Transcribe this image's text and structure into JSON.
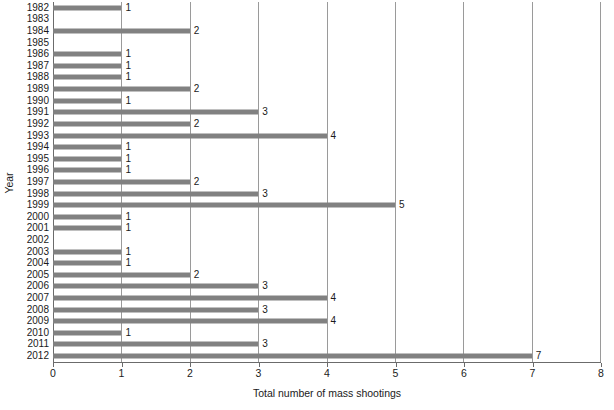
{
  "chart_data": {
    "type": "bar",
    "orientation": "horizontal",
    "title": "",
    "xlabel": "Total number of mass shootings",
    "ylabel": "Year",
    "categories": [
      "1982",
      "1983",
      "1984",
      "1985",
      "1986",
      "1987",
      "1988",
      "1989",
      "1990",
      "1991",
      "1992",
      "1993",
      "1994",
      "1995",
      "1996",
      "1997",
      "1998",
      "1999",
      "2000",
      "2001",
      "2002",
      "2003",
      "2004",
      "2005",
      "2006",
      "2007",
      "2008",
      "2009",
      "2010",
      "2011",
      "2012"
    ],
    "values": [
      1,
      0,
      2,
      0,
      1,
      1,
      1,
      2,
      1,
      3,
      2,
      4,
      1,
      1,
      1,
      2,
      3,
      5,
      1,
      1,
      0,
      1,
      1,
      2,
      3,
      4,
      3,
      4,
      1,
      3,
      7
    ],
    "data_labels": [
      "1",
      "",
      "2",
      "",
      "1",
      "1",
      "1",
      "2",
      "1",
      "3",
      "2",
      "4",
      "1",
      "1",
      "1",
      "2",
      "3",
      "5",
      "1",
      "1",
      "",
      "1",
      "1",
      "2",
      "3",
      "4",
      "3",
      "4",
      "1",
      "3",
      "7"
    ],
    "xlim": [
      0,
      8
    ],
    "xticks": [
      0,
      1,
      2,
      3,
      4,
      5,
      6,
      7,
      8
    ],
    "xtick_labels": [
      "0",
      "1",
      "2",
      "3",
      "4",
      "5",
      "6",
      "7",
      "8"
    ],
    "grid": "vertical",
    "legend": "none",
    "bar_color": "#818181",
    "gridline_color": "#9a9a9a",
    "axis_color": "#6b6b6b",
    "background_color": "#ffffff"
  }
}
